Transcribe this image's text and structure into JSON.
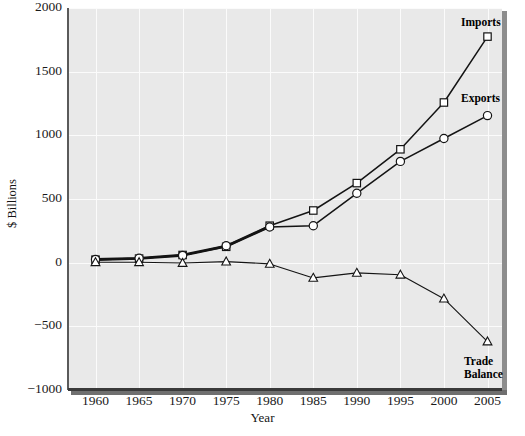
{
  "chart_data": {
    "type": "line",
    "title": "",
    "xlabel": "Year",
    "ylabel": "$ Billions",
    "x": [
      1960,
      1965,
      1970,
      1975,
      1980,
      1985,
      1990,
      1995,
      2000,
      2005
    ],
    "categories": [
      "1960",
      "1965",
      "1970",
      "1975",
      "1980",
      "1985",
      "1990",
      "1995",
      "2000",
      "2005"
    ],
    "xlim": [
      1958,
      2007
    ],
    "ylim": [
      -1000,
      2000
    ],
    "ytick_labels": [
      "2000",
      "1500",
      "1000",
      "500",
      "0",
      "−500",
      "−1000"
    ],
    "yticks": [
      2000,
      1500,
      1000,
      500,
      0,
      -500,
      -1000
    ],
    "grid": "both",
    "legend_position": "inline-annotations",
    "series": [
      {
        "name": "Imports",
        "marker": "square",
        "label": "Imports",
        "values": [
          23,
          32,
          60,
          125,
          290,
          410,
          625,
          890,
          1258,
          1775
        ]
      },
      {
        "name": "Exports",
        "marker": "circle",
        "label": "Exports",
        "values": [
          26,
          35,
          57,
          133,
          280,
          290,
          545,
          795,
          975,
          1155
        ]
      },
      {
        "name": "Trade Balance",
        "marker": "triangle",
        "label": "Trade\nBalance",
        "label_line1": "Trade",
        "label_line2": "Balance",
        "values": [
          3,
          3,
          -3,
          8,
          -10,
          -120,
          -80,
          -95,
          -283,
          -620
        ]
      }
    ],
    "colors": {
      "line": "#141414",
      "marker_fill": "#ffffff",
      "plot_background": "#e9e9e9",
      "gridline": "#fbfbfb",
      "axis": "#3a3a3a",
      "text": "#141414"
    }
  }
}
